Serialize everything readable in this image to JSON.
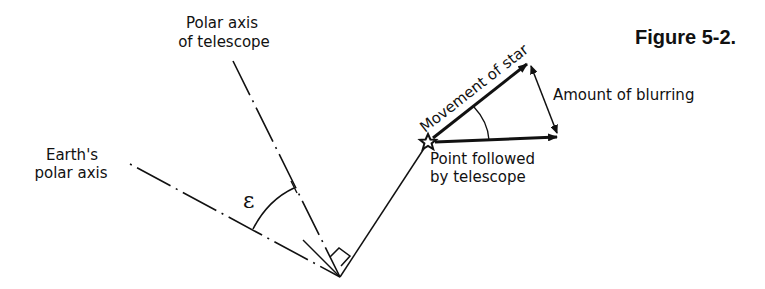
{
  "figure": {
    "title": "Figure 5-2."
  },
  "labels": {
    "telescope_axis_line1": "Polar axis",
    "telescope_axis_line2": "of telescope",
    "earth_axis_line1": "Earth's",
    "earth_axis_line2": "polar axis",
    "angle_symbol": "ε",
    "movement_of_star": "Movement of star",
    "amount_of_blurring": "Amount of blurring",
    "point_followed_line1": "Point followed",
    "point_followed_line2": "by telescope"
  },
  "geometry": {
    "vertex": [
      340,
      277
    ],
    "star": [
      428,
      142
    ],
    "telescope_axis_start": [
      233,
      61
    ],
    "earth_axis_start": [
      130,
      164
    ],
    "movement_arrow_tip": [
      528,
      63
    ],
    "followed_arrow_tip": [
      558,
      137
    ]
  },
  "colors": {
    "ink": "#111111",
    "background": "#ffffff"
  }
}
